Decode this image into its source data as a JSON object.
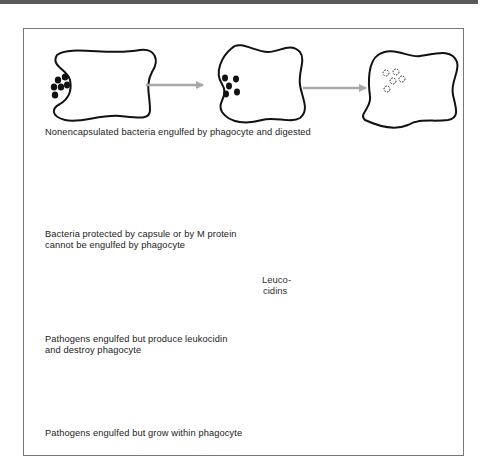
{
  "figure": {
    "rows": [
      {
        "id": "row-1",
        "caption": "Nonencapsulated bacteria engulfed by phagocyte and digested",
        "stages": [
          "phagocyte with bacteria at surface",
          "bacteria engulfed",
          "bacteria digested (dashed outlines)"
        ]
      },
      {
        "id": "row-2",
        "caption_line1": "Bacteria protected by capsule or by M protein",
        "caption_line2": "cannot be engulfed by phagocyte",
        "stages": [
          "phagocyte with capsulated bacteria",
          "bacteria remain outside phagocyte"
        ]
      },
      {
        "id": "row-3",
        "caption_line1": "Pathogens engulfed but produce leukocidin",
        "caption_line2": "and destroy phagocyte",
        "inner_label_line1": "Leuco-",
        "inner_label_line2": "cidins",
        "stages": [
          "phagocyte with bacteria",
          "engulfed bacteria release leucocidins",
          "phagocyte destroyed (dashed membrane)"
        ]
      },
      {
        "id": "row-4",
        "caption": "Pathogens engulfed but grow within phagocyte",
        "stages": [
          "phagocyte with bacteria",
          "bacteria engulfed",
          "bacteria multiply inside phagocyte"
        ]
      }
    ],
    "colors": {
      "outline": "#111111",
      "arrow": "#a8a8a8",
      "frame": "#777777",
      "topbar": "#5a5a5a"
    }
  }
}
